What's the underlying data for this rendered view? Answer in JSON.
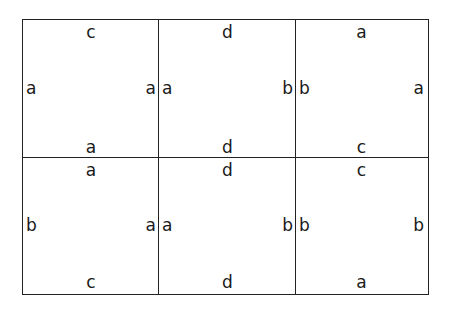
{
  "tiles": [
    {
      "top": "c",
      "left": "a",
      "right": "a",
      "bottom": "a"
    },
    {
      "top": "d",
      "left": "a",
      "right": "b",
      "bottom": "d"
    },
    {
      "top": "a",
      "left": "b",
      "right": "a",
      "bottom": "c"
    },
    {
      "top": "a",
      "left": "b",
      "right": "a",
      "bottom": "c"
    },
    {
      "top": "d",
      "left": "a",
      "right": "b",
      "bottom": "d"
    },
    {
      "top": "c",
      "left": "b",
      "right": "b",
      "bottom": "a"
    }
  ]
}
